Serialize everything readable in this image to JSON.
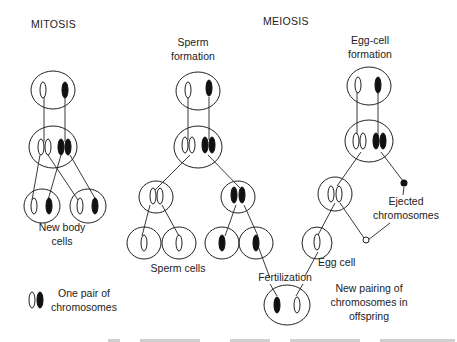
{
  "figure": {
    "sections": {
      "mitosis": {
        "title": "MITOSIS",
        "result_label_line1": "New body",
        "result_label_line2": "cells"
      },
      "meiosis": {
        "title": "MEIOSIS",
        "sperm": {
          "label_line1": "Sperm",
          "label_line2": "formation",
          "result_label": "Sperm cells"
        },
        "egg": {
          "label_line1": "Egg-cell",
          "label_line2": "formation",
          "result_label": "Egg cell",
          "ejected_line1": "Ejected",
          "ejected_line2": "chromosomes"
        },
        "fertilization_label": "Fertilization",
        "offspring_line1": "New pairing of",
        "offspring_line2": "chromosomes in",
        "offspring_line3": "offspring"
      }
    },
    "legend": {
      "line1": "One pair of",
      "line2": "chromosomes"
    },
    "colors": {
      "ink": "#222222",
      "filled_chromosome": "#111111",
      "background": "#ffffff"
    },
    "footer_caption": "(cut-off caption text, illegible)"
  }
}
